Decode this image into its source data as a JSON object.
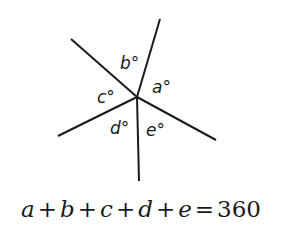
{
  "diagram": {
    "vertex": {
      "x": 137,
      "y": 97
    },
    "rays": [
      {
        "id": "ray-top",
        "x2": 160,
        "y2": 19
      },
      {
        "id": "ray-upper-left",
        "x2": 71,
        "y2": 39
      },
      {
        "id": "ray-left",
        "x2": 58,
        "y2": 136
      },
      {
        "id": "ray-bottom",
        "x2": 139,
        "y2": 181
      },
      {
        "id": "ray-lower-right",
        "x2": 216,
        "y2": 140
      }
    ],
    "angle_labels": [
      {
        "id": "a",
        "text": "a°",
        "x": 152,
        "y": 93
      },
      {
        "id": "b",
        "text": "b°",
        "x": 120,
        "y": 69
      },
      {
        "id": "c",
        "text": "c°",
        "x": 97,
        "y": 103
      },
      {
        "id": "d",
        "text": "d°",
        "x": 110,
        "y": 134
      },
      {
        "id": "e",
        "text": "e°",
        "x": 146,
        "y": 136
      }
    ],
    "stroke_color": "#1a1a1a"
  },
  "equation": {
    "terms": [
      "a",
      "b",
      "c",
      "d",
      "e"
    ],
    "plus": "+",
    "equals": "=",
    "result": "360",
    "full_text": "a + b + c + d + e = 360"
  }
}
